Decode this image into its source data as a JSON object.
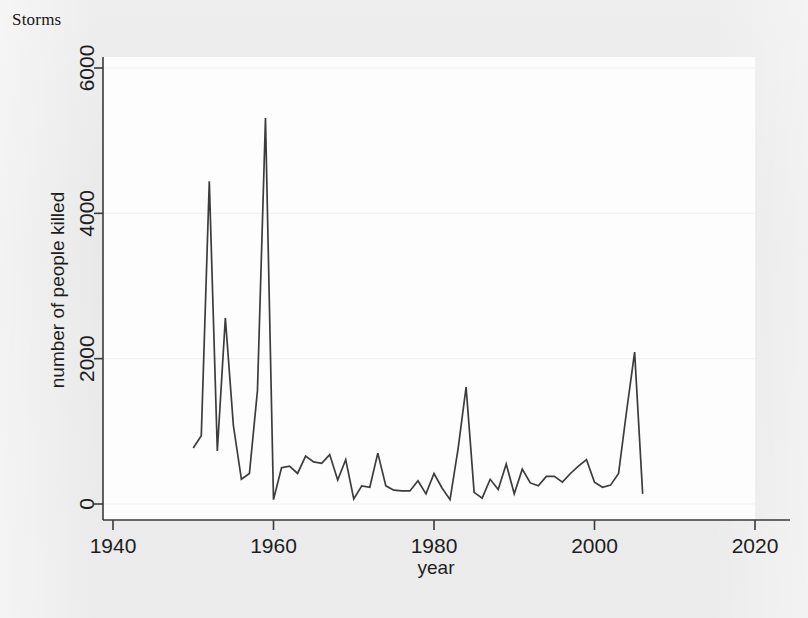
{
  "title": "Storms",
  "chart_data": {
    "type": "line",
    "title": "Storms",
    "xlabel": "year",
    "ylabel": "number of people killed",
    "xlim": [
      1940,
      2020
    ],
    "ylim": [
      0,
      6000
    ],
    "xticks": [
      1940,
      1960,
      1980,
      2000,
      2020
    ],
    "yticks": [
      0,
      2000,
      4000,
      6000
    ],
    "xtick_labels": [
      "1940",
      "1960",
      "1980",
      "2000",
      "2020"
    ],
    "ytick_labels": [
      "0",
      "2000",
      "4000",
      "6000"
    ],
    "grid": true,
    "legend": null,
    "series": [
      {
        "name": "number of people killed",
        "color": "#3c3c3c",
        "x": [
          1950,
          1951,
          1952,
          1953,
          1954,
          1955,
          1956,
          1957,
          1958,
          1959,
          1960,
          1961,
          1962,
          1963,
          1964,
          1965,
          1966,
          1967,
          1968,
          1969,
          1970,
          1971,
          1972,
          1973,
          1974,
          1975,
          1976,
          1977,
          1978,
          1979,
          1980,
          1981,
          1982,
          1983,
          1984,
          1985,
          1986,
          1987,
          1988,
          1989,
          1990,
          1991,
          1992,
          1993,
          1994,
          1995,
          1996,
          1997,
          1998,
          1999,
          2000,
          2001,
          2002,
          2003,
          2004,
          2005,
          2006
        ],
        "values": [
          770,
          940,
          4440,
          730,
          2560,
          1080,
          340,
          420,
          1560,
          5310,
          60,
          500,
          520,
          420,
          660,
          580,
          560,
          680,
          330,
          610,
          70,
          250,
          230,
          700,
          250,
          190,
          180,
          180,
          320,
          140,
          420,
          220,
          60,
          760,
          1610,
          160,
          80,
          340,
          200,
          550,
          140,
          480,
          290,
          250,
          380,
          380,
          300,
          420,
          520,
          610,
          300,
          230,
          260,
          420,
          1280,
          2090,
          140
        ]
      }
    ]
  },
  "axes": {
    "y_title": "number of people killed",
    "x_title": "year"
  }
}
